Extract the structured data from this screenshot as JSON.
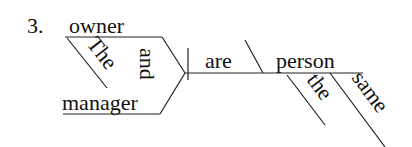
{
  "diagram": {
    "type": "sentence-diagram",
    "number": "3.",
    "subject": {
      "compound": true,
      "nouns": [
        "owner",
        "manager"
      ],
      "conjunction": "and",
      "modifier": "The"
    },
    "verb": "are",
    "predicate_nominative": {
      "noun": "person",
      "modifiers": [
        "the",
        "same"
      ]
    }
  },
  "colors": {
    "ink": "#222222",
    "background": "#ffffff"
  }
}
